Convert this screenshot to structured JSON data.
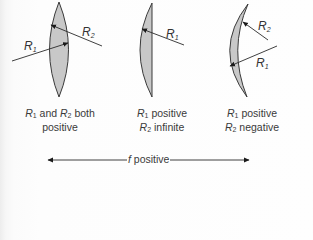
{
  "figure": {
    "lenses": [
      {
        "id": "biconvex",
        "radii_labels": [
          {
            "symbol": "R",
            "subscript": "1"
          },
          {
            "symbol": "R",
            "subscript": "2"
          }
        ],
        "caption": {
          "line1": {
            "r1": "R",
            "r1_sub": "1",
            "mid": " and ",
            "r2": "R",
            "r2_sub": "2",
            "tail": " both"
          },
          "line2": "positive"
        }
      },
      {
        "id": "plano-convex",
        "radii_labels": [
          {
            "symbol": "R",
            "subscript": "1"
          }
        ],
        "caption": {
          "line1": {
            "r": "R",
            "sub": "1",
            "text": " positive"
          },
          "line2": {
            "r": "R",
            "sub": "2",
            "text": " infinite"
          }
        }
      },
      {
        "id": "meniscus",
        "radii_labels": [
          {
            "symbol": "R",
            "subscript": "2"
          },
          {
            "symbol": "R",
            "subscript": "1"
          }
        ],
        "caption": {
          "line1": {
            "r": "R",
            "sub": "1",
            "text": " positive"
          },
          "line2": {
            "r": "R",
            "sub": "2",
            "text": " negative"
          }
        }
      }
    ],
    "focal_axis": {
      "symbol": "f",
      "text": " positive"
    },
    "colors": {
      "lens_fill": "#c8c8c8",
      "lens_stroke": "#3a3a3a",
      "text": "#333333"
    }
  }
}
